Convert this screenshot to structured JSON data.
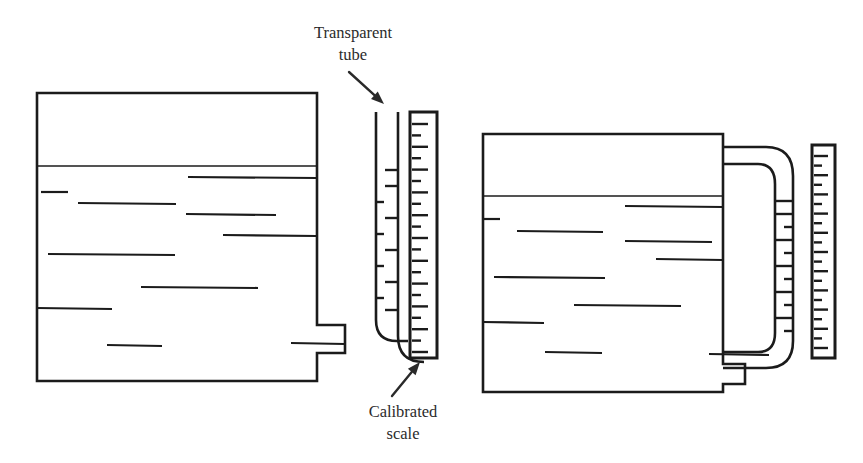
{
  "figure": {
    "background_color": "#ffffff",
    "ink_color": "#1b1b1b",
    "width": 863,
    "height": 463
  },
  "annotations": [
    {
      "id": "transparent-tube",
      "line1": "Transparent",
      "line2": "tube",
      "text_x": 353,
      "line1_y": 38,
      "line2_y": 60,
      "leader": {
        "x1": 349,
        "y1": 72,
        "x2": 384,
        "y2": 104
      }
    },
    {
      "id": "calibrated-scale",
      "line1": "Calibrated",
      "line2": "scale",
      "text_x": 403,
      "line1_y": 417,
      "line2_y": 439,
      "leader": {
        "x1": 392,
        "y1": 396,
        "x2": 420,
        "y2": 362
      }
    }
  ],
  "left_assembly": {
    "name": "external-sight-tube-assembly",
    "vessel": {
      "outline": "M 37 93 L 317 93 L 317 325 L 345 325 L 345 353 L 317 353 L 317 381 L 37 381 Z",
      "liquid_surface_y": 166,
      "liquid_surface_x1": 37,
      "liquid_surface_x2": 317,
      "hatch_lines": [
        {
          "x1": 188,
          "y1": 177,
          "x2": 317,
          "y2": 178
        },
        {
          "x1": 41,
          "y1": 192,
          "x2": 68,
          "y2": 192
        },
        {
          "x1": 78,
          "y1": 203,
          "x2": 176,
          "y2": 204
        },
        {
          "x1": 186,
          "y1": 214,
          "x2": 276,
          "y2": 215
        },
        {
          "x1": 223,
          "y1": 235,
          "x2": 317,
          "y2": 236
        },
        {
          "x1": 48,
          "y1": 254,
          "x2": 175,
          "y2": 255
        },
        {
          "x1": 141,
          "y1": 287,
          "x2": 258,
          "y2": 288
        },
        {
          "x1": 37,
          "y1": 308,
          "x2": 112,
          "y2": 309
        },
        {
          "x1": 107,
          "y1": 345,
          "x2": 162,
          "y2": 346
        },
        {
          "x1": 291,
          "y1": 343,
          "x2": 345,
          "y2": 344
        }
      ]
    },
    "tube": {
      "outer_wall": "M 376 112 L 376 320 Q 376 341 397 341 L 408 341",
      "inner_wall": "M 398 112 L 398 336 Q 398 362 424 362",
      "top_y": 112,
      "left_x": 376,
      "right_x": 398,
      "ticks": [
        {
          "side": "right",
          "y": 170,
          "length": 13
        },
        {
          "side": "right",
          "y": 186,
          "length": 13
        },
        {
          "side": "left",
          "y": 202,
          "length": 8
        },
        {
          "side": "right",
          "y": 218,
          "length": 13
        },
        {
          "side": "left",
          "y": 234,
          "length": 8
        },
        {
          "side": "right",
          "y": 250,
          "length": 13
        },
        {
          "side": "left",
          "y": 266,
          "length": 8
        },
        {
          "side": "right",
          "y": 282,
          "length": 13
        },
        {
          "side": "left",
          "y": 298,
          "length": 8
        },
        {
          "side": "right",
          "y": 310,
          "length": 13
        }
      ]
    },
    "scale": {
      "name": "calibrated-scale-left",
      "x": 410,
      "y": 112,
      "width": 27,
      "height": 246,
      "tick_start_y": 124,
      "tick_spacing": 11.4,
      "tick_count": 21,
      "long_tick_length": 16,
      "short_tick_length": 9
    }
  },
  "right_assembly": {
    "name": "u-bend-sight-tube-assembly",
    "vessel": {
      "outline": "M 483 134 L 723 134 L 723 364 L 745 364 L 745 384 L 723 384 L 723 392 L 483 392 Z",
      "liquid_surface_y": 196,
      "liquid_surface_x1": 483,
      "liquid_surface_x2": 723,
      "hatch_lines": [
        {
          "x1": 625,
          "y1": 206,
          "x2": 723,
          "y2": 207
        },
        {
          "x1": 483,
          "y1": 219,
          "x2": 500,
          "y2": 219
        },
        {
          "x1": 517,
          "y1": 231,
          "x2": 603,
          "y2": 232
        },
        {
          "x1": 625,
          "y1": 241,
          "x2": 712,
          "y2": 242
        },
        {
          "x1": 656,
          "y1": 259,
          "x2": 723,
          "y2": 260
        },
        {
          "x1": 494,
          "y1": 277,
          "x2": 605,
          "y2": 278
        },
        {
          "x1": 574,
          "y1": 305,
          "x2": 681,
          "y2": 306
        },
        {
          "x1": 483,
          "y1": 322,
          "x2": 544,
          "y2": 323
        },
        {
          "x1": 545,
          "y1": 352,
          "x2": 602,
          "y2": 353
        },
        {
          "x1": 709,
          "y1": 354,
          "x2": 769,
          "y2": 355
        }
      ]
    },
    "tube": {
      "outer_wall": "M 723 147 L 766 147 Q 793 147 793 176 L 793 341 Q 793 368 766 368 L 723 368",
      "inner_wall": "M 723 164 L 758 164 Q 775 164 775 184 L 775 333 Q 775 352 758 352 L 723 352",
      "ticks": [
        {
          "x1": 775,
          "x2": 793,
          "y": 201
        },
        {
          "x1": 775,
          "x2": 793,
          "y": 214
        },
        {
          "x1": 784,
          "x2": 793,
          "y": 227
        },
        {
          "x1": 775,
          "x2": 793,
          "y": 240
        },
        {
          "x1": 784,
          "x2": 793,
          "y": 253
        },
        {
          "x1": 775,
          "x2": 793,
          "y": 266
        },
        {
          "x1": 784,
          "x2": 793,
          "y": 279
        },
        {
          "x1": 775,
          "x2": 793,
          "y": 292
        },
        {
          "x1": 784,
          "x2": 793,
          "y": 305
        },
        {
          "x1": 775,
          "x2": 793,
          "y": 318
        },
        {
          "x1": 784,
          "x2": 793,
          "y": 331
        }
      ]
    },
    "scale": {
      "name": "calibrated-scale-right",
      "x": 812,
      "y": 145,
      "width": 23,
      "height": 213,
      "tick_start_y": 156,
      "tick_spacing": 9.6,
      "tick_count": 21,
      "long_tick_length": 14,
      "short_tick_length": 8
    }
  }
}
